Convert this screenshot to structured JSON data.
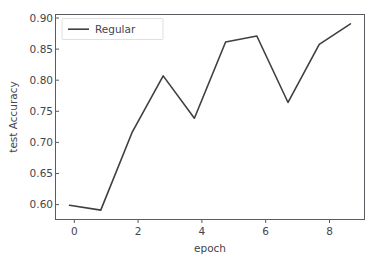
{
  "chart_data": {
    "type": "line",
    "title": "",
    "xlabel": "epoch",
    "ylabel": "test Accuracy",
    "x": [
      0,
      1,
      2,
      3,
      4,
      5,
      6,
      7,
      8,
      9
    ],
    "series": [
      {
        "name": "Regular",
        "color": "#3f3f44",
        "values": [
          0.602,
          0.594,
          0.722,
          0.816,
          0.746,
          0.872,
          0.882,
          0.772,
          0.868,
          0.902
        ]
      }
    ],
    "xlim": [
      -0.45,
      9.45
    ],
    "ylim": [
      0.5785,
      0.9175
    ],
    "xticks": [
      0,
      2,
      4,
      6,
      8
    ],
    "xtick_labels": [
      "0",
      "2",
      "4",
      "6",
      "8"
    ],
    "yticks": [
      0.6,
      0.65,
      0.7,
      0.75,
      0.8,
      0.85,
      0.9
    ],
    "ytick_labels": [
      "0.60",
      "0.65",
      "0.70",
      "0.75",
      "0.80",
      "0.85",
      "0.90"
    ],
    "grid": false,
    "legend_position": "upper left",
    "legend_entries": [
      "Regular"
    ],
    "background_color": "#ffffff",
    "axis_color": "#5a5a60"
  }
}
